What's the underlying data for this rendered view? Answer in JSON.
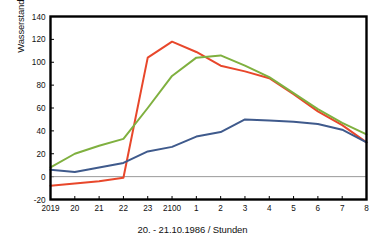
{
  "chart_data": {
    "type": "line",
    "title": "",
    "xlabel": "20. - 21.10.1986 / Stunden",
    "ylabel": "Wasserstand ü. NN/cm",
    "x": [
      "2019",
      "20",
      "21",
      "22",
      "23",
      "2100",
      "1",
      "2",
      "3",
      "4",
      "5",
      "6",
      "7",
      "8"
    ],
    "xtick_labels": [
      "2019",
      "20",
      "21",
      "22",
      "23",
      "2100",
      "1",
      "2",
      "3",
      "4",
      "5",
      "6",
      "7",
      "8"
    ],
    "ytick_labels": [
      "140",
      "120",
      "100",
      "80",
      "60",
      "40",
      "20",
      "0",
      "-20"
    ],
    "yticks": [
      140,
      120,
      100,
      80,
      60,
      40,
      20,
      0,
      -20
    ],
    "ylim": [
      -20,
      140
    ],
    "grid": false,
    "legend": "none",
    "zero_line": 0,
    "series": [
      {
        "name": "red",
        "color": "#E8472B",
        "values": [
          -8,
          -6,
          -4,
          -1,
          104,
          118,
          109,
          97,
          92,
          86,
          72,
          57,
          45,
          30
        ]
      },
      {
        "name": "green",
        "color": "#7FB03F",
        "values": [
          8,
          20,
          27,
          33,
          60,
          88,
          104,
          106,
          97,
          87,
          73,
          59,
          47,
          37
        ]
      },
      {
        "name": "blue",
        "color": "#3F5A8C",
        "values": [
          6,
          4,
          8,
          12,
          22,
          26,
          35,
          39,
          50,
          49,
          48,
          46,
          41,
          30
        ]
      }
    ]
  },
  "axes": {
    "y_title": "Wasserstand ü. NN/cm",
    "x_title": "20. - 21.10.1986 / Stunden"
  },
  "style": {
    "frame_color": "#000000",
    "zero_line_color": "#9a9a9a",
    "background": "#ffffff"
  }
}
